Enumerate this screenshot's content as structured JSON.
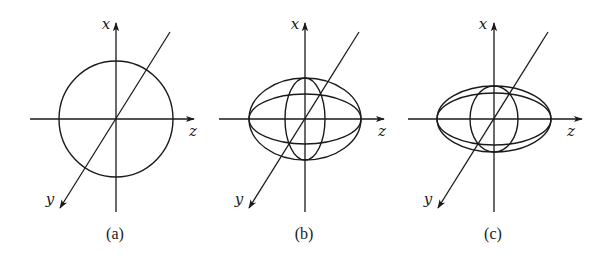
{
  "figure": {
    "ink_color": "#1a1a1a",
    "background": "#ffffff",
    "axis_labels": {
      "vertical": "x",
      "horizontal": "z",
      "diagonal": "y"
    },
    "panels": [
      {
        "id": "a",
        "caption": "(a)",
        "description": "sphere",
        "center": [
          116,
          119
        ],
        "h_axis": [
          30,
          194
        ],
        "v_axis": [
          23,
          212
        ],
        "diag_from": [
          170,
          32
        ],
        "diag_to": [
          60,
          208
        ],
        "ellipses": [
          {
            "rx": 57,
            "ry": 58
          }
        ],
        "label_pos": {
          "x": [
            106,
            29
          ],
          "z": [
            193,
            136
          ],
          "y": [
            50,
            204
          ]
        },
        "caption_pos": [
          115,
          239
        ]
      },
      {
        "id": "b",
        "caption": "(b)",
        "description": "prolate/ellipsoid with meridian sections",
        "center": [
          305,
          119
        ],
        "h_axis": [
          219,
          384
        ],
        "v_axis": [
          23,
          212
        ],
        "diag_from": [
          359,
          32
        ],
        "diag_to": [
          249,
          208
        ],
        "ellipses": [
          {
            "rx": 56,
            "ry": 41
          },
          {
            "rx": 56,
            "ry": 25
          },
          {
            "rx": 20,
            "ry": 41
          }
        ],
        "label_pos": {
          "x": [
            295,
            29
          ],
          "z": [
            382,
            136
          ],
          "y": [
            239,
            204
          ]
        },
        "caption_pos": [
          304,
          239
        ]
      },
      {
        "id": "c",
        "caption": "(c)",
        "description": "flattened ellipsoid with meridian sections",
        "center": [
          494,
          119
        ],
        "h_axis": [
          408,
          582
        ],
        "v_axis": [
          23,
          212
        ],
        "diag_from": [
          548,
          32
        ],
        "diag_to": [
          438,
          208
        ],
        "ellipses": [
          {
            "rx": 57,
            "ry": 33
          },
          {
            "rx": 57,
            "ry": 26
          },
          {
            "rx": 24,
            "ry": 33
          }
        ],
        "label_pos": {
          "x": [
            483,
            29
          ],
          "z": [
            571,
            136
          ],
          "y": [
            428,
            204
          ]
        },
        "caption_pos": [
          493,
          239
        ]
      }
    ]
  }
}
